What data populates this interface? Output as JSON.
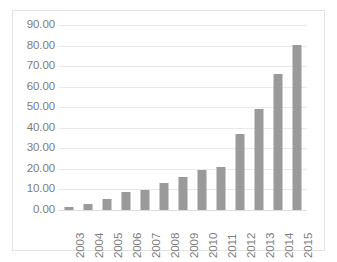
{
  "chart_data": {
    "type": "bar",
    "title": "",
    "subtitle": "",
    "xlabel": "",
    "ylabel": "",
    "categories": [
      "2003",
      "2004",
      "2005",
      "2006",
      "2007",
      "2008",
      "2009",
      "2010",
      "2011",
      "2012",
      "2013",
      "2014",
      "2015"
    ],
    "values": [
      1.5,
      3.0,
      5.5,
      9.0,
      9.7,
      13.0,
      16.2,
      19.5,
      21.0,
      36.8,
      49.0,
      66.0,
      80.2
    ],
    "ylim": [
      0,
      90
    ],
    "ytick_step": 10,
    "ytick_labels": [
      "90.00",
      "80.00",
      "70.00",
      "60.00",
      "50.00",
      "40.00",
      "30.00",
      "20.00",
      "10.00",
      "0.00"
    ],
    "ytick_values": [
      90,
      80,
      70,
      60,
      50,
      40,
      30,
      20,
      10,
      0
    ],
    "grid": true,
    "legend": false,
    "legend_position": "none",
    "series": [
      {
        "name": "",
        "values": [
          1.5,
          3.0,
          5.5,
          9.0,
          9.7,
          13.0,
          16.2,
          19.5,
          21.0,
          36.8,
          49.0,
          66.0,
          80.2
        ]
      }
    ],
    "x_tick_rotation": -90,
    "annotations": []
  },
  "style": {
    "bar_color": "#9a9a9a",
    "gridline_color": "#e9e9e9",
    "baseline_color": "#dddddd",
    "text_color": "#7d7d7d",
    "border_color": "#e3e3e3",
    "background_color": "#ffffff"
  }
}
